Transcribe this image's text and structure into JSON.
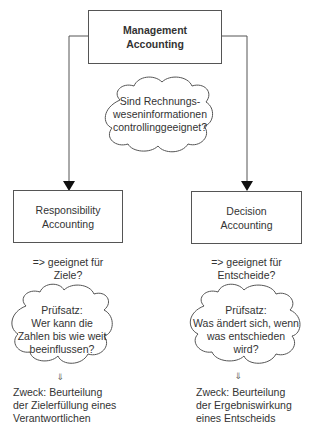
{
  "diagram": {
    "root": {
      "lines": [
        "Management",
        "Accounting"
      ]
    },
    "central_question": {
      "lines": [
        "Sind Rechnungs-",
        "weseninformationen",
        "controllinggeeignet?"
      ]
    },
    "branches": [
      {
        "id": "responsibility",
        "box": {
          "lines": [
            "Responsibility",
            "Accounting"
          ]
        },
        "suitability": {
          "lines": [
            "=> geeignet für",
            "Ziele?"
          ]
        },
        "test": {
          "lines": [
            "Prüfsatz:",
            "Wer kann die",
            "Zahlen bis wie weit",
            "beeinflussen?"
          ]
        },
        "arrow_glyph": "⇓",
        "purpose": {
          "lines": [
            "Zweck: Beurteilung",
            "der Zielerfüllung eines",
            "Verantwortlichen"
          ]
        }
      },
      {
        "id": "decision",
        "box": {
          "lines": [
            "Decision",
            "Accounting"
          ]
        },
        "suitability": {
          "lines": [
            "=> geeignet für",
            "Entscheide?"
          ]
        },
        "test": {
          "lines": [
            "Prüfsatz:",
            "Was ändert sich, wenn",
            "was entschieden",
            "wird?"
          ]
        },
        "arrow_glyph": "⇓",
        "purpose": {
          "lines": [
            "Zweck: Beurteilung",
            "der Ergebniswirkung",
            "eines Entscheids"
          ]
        }
      }
    ],
    "colors": {
      "stroke": "#555555",
      "text": "#333333",
      "background": "#ffffff"
    }
  }
}
